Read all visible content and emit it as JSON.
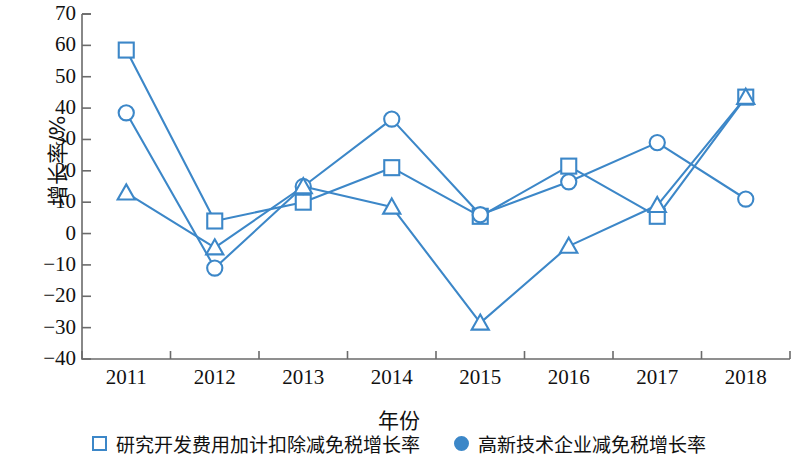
{
  "chart_data": {
    "type": "line",
    "title": "",
    "xlabel": "年份",
    "ylabel": "增长率/%",
    "x": [
      "2011",
      "2012",
      "2013",
      "2014",
      "2015",
      "2016",
      "2017",
      "2018"
    ],
    "categories": [
      "2011",
      "2012",
      "2013",
      "2014",
      "2015",
      "2016",
      "2017",
      "2018"
    ],
    "ylim": [
      -40,
      70
    ],
    "y_ticks": [
      70,
      60,
      50,
      40,
      30,
      20,
      10,
      0,
      "−10",
      "−20",
      "−30",
      "−40"
    ],
    "y_tick_values": [
      70,
      60,
      50,
      40,
      30,
      20,
      10,
      0,
      -10,
      -20,
      -30,
      -40
    ],
    "grid": false,
    "legend_position": "bottom",
    "series": [
      {
        "name": "研究开发费用加计扣除减免税增长率",
        "marker": "square",
        "color": "#3c87c8",
        "values": [
          58.5,
          4,
          10,
          21,
          5.5,
          21.5,
          5.5,
          43.5
        ]
      },
      {
        "name": "高新技术企业减免税增长率",
        "marker": "circle",
        "color": "#3c87c8",
        "values": [
          38.5,
          -11,
          15,
          36.5,
          6,
          16.5,
          29,
          11
        ]
      },
      {
        "name": "",
        "marker": "triangle",
        "color": "#3c87c8",
        "values": [
          13,
          -4.5,
          15,
          8.5,
          -28.5,
          -4,
          9,
          43.5
        ]
      }
    ]
  },
  "axis": {
    "y_title": "增长率/%",
    "x_title": "年份",
    "y_labels": [
      "70",
      "60",
      "50",
      "40",
      "30",
      "20",
      "10",
      "0",
      "−10",
      "−20",
      "−30",
      "−40"
    ],
    "x_labels": [
      "2011",
      "2012",
      "2013",
      "2014",
      "2015",
      "2016",
      "2017",
      "2018"
    ]
  },
  "legend": {
    "items": [
      {
        "marker": "square",
        "label": "研究开发费用加计扣除减免税增长率"
      },
      {
        "marker": "circle",
        "label": "高新技术企业减免税增长率"
      }
    ]
  },
  "colors": {
    "series": "#3c87c8",
    "axis": "#6b6b6b",
    "text": "#111111"
  }
}
